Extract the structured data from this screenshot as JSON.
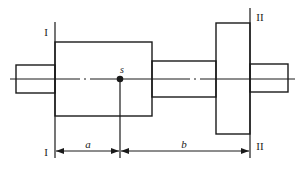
{
  "diagram": {
    "type": "shaft-with-two-correction-planes",
    "colors": {
      "line": "#1a1a1a",
      "background": "#ffffff"
    },
    "planes": [
      {
        "id": "plane-I",
        "label_top": "I",
        "label_bottom": "I"
      },
      {
        "id": "plane-II",
        "label_top": "II",
        "label_bottom": "II"
      }
    ],
    "center_of_mass": {
      "label": "s"
    },
    "dimensions": [
      {
        "id": "dim-a",
        "label": "a",
        "from": "plane-I",
        "to": "s"
      },
      {
        "id": "dim-b",
        "label": "b",
        "from": "s",
        "to": "plane-II"
      }
    ]
  }
}
